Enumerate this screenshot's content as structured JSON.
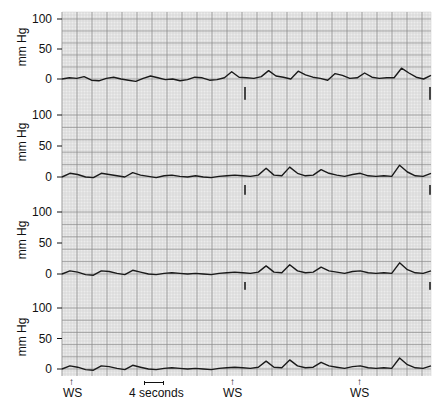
{
  "chart_data": {
    "type": "line",
    "title": "",
    "panels": 4,
    "ylabel": "mm Hg",
    "yticks": [
      0,
      50,
      100
    ],
    "ylim": [
      -5,
      110
    ],
    "grid": true,
    "time_scale_label": "4 seconds",
    "event_markers": [
      {
        "label": "WS",
        "x_px": 72
      },
      {
        "label": "WS",
        "x_px": 233
      },
      {
        "label": "WS",
        "x_px": 360
      }
    ],
    "series": [
      {
        "name": "trace-1",
        "values": [
          0,
          2,
          1,
          4,
          -2,
          -3,
          1,
          3,
          0,
          -2,
          -4,
          1,
          5,
          2,
          -1,
          0,
          -3,
          -1,
          3,
          2,
          -2,
          -1,
          2,
          12,
          3,
          2,
          1,
          4,
          14,
          5,
          3,
          0,
          13,
          7,
          3,
          1,
          -2,
          9,
          6,
          1,
          2,
          10,
          3,
          1,
          2,
          2,
          18,
          10,
          3,
          0,
          6
        ]
      },
      {
        "name": "trace-2",
        "values": [
          0,
          6,
          4,
          0,
          -1,
          6,
          4,
          2,
          0,
          7,
          3,
          1,
          -1,
          2,
          3,
          1,
          0,
          2,
          0,
          -1,
          1,
          2,
          3,
          2,
          1,
          3,
          14,
          3,
          2,
          16,
          6,
          2,
          3,
          12,
          6,
          3,
          1,
          4,
          6,
          2,
          1,
          2,
          1,
          19,
          8,
          2,
          1,
          6
        ]
      },
      {
        "name": "trace-3",
        "values": [
          0,
          5,
          3,
          -1,
          -2,
          5,
          4,
          1,
          -1,
          6,
          3,
          0,
          -1,
          1,
          2,
          1,
          0,
          1,
          0,
          -1,
          1,
          2,
          3,
          2,
          1,
          3,
          13,
          3,
          2,
          15,
          5,
          2,
          3,
          11,
          5,
          3,
          1,
          4,
          5,
          2,
          1,
          2,
          1,
          18,
          7,
          2,
          1,
          5
        ]
      },
      {
        "name": "trace-4",
        "values": [
          0,
          5,
          3,
          -1,
          -2,
          5,
          4,
          1,
          -1,
          6,
          3,
          0,
          -1,
          1,
          2,
          1,
          0,
          1,
          0,
          -1,
          1,
          2,
          3,
          2,
          1,
          3,
          13,
          3,
          2,
          15,
          5,
          2,
          3,
          11,
          5,
          3,
          1,
          4,
          5,
          2,
          1,
          2,
          1,
          18,
          7,
          2,
          1,
          5
        ]
      }
    ]
  },
  "axis": {
    "ylabel": "mm Hg",
    "ticks": {
      "t100": "100",
      "t50": "50",
      "t0": "0"
    }
  },
  "annotations": {
    "ws1": "WS",
    "ws2": "WS",
    "ws3": "WS",
    "arrow": "↑",
    "scale": "4 seconds"
  },
  "colors": {
    "grid_major": "#8a8a8a",
    "grid_minor": "#c8c8c8",
    "trace": "#1a1a1a",
    "paper": "#ececec"
  }
}
